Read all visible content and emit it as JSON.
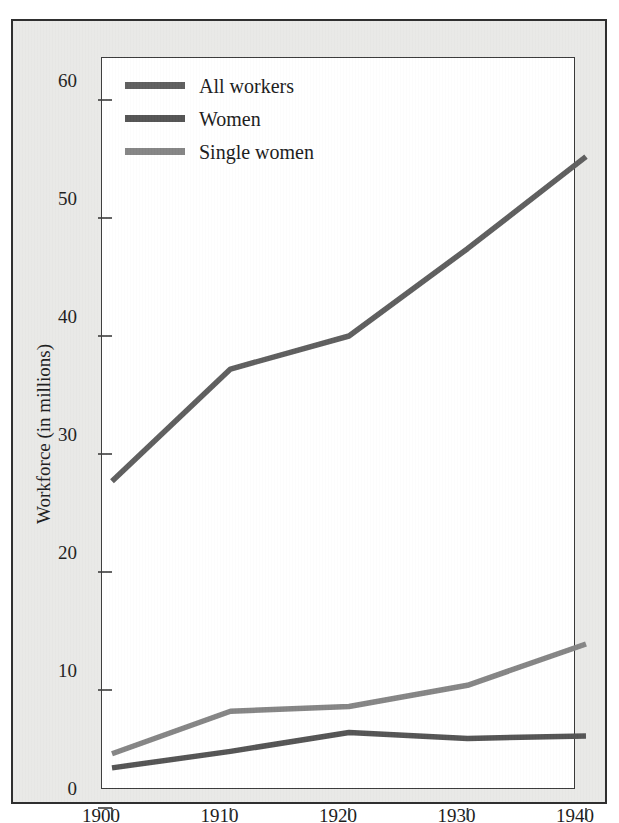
{
  "chart_data": {
    "type": "line",
    "title": "",
    "xlabel": "",
    "ylabel": "Workforce (in millions)",
    "x": [
      1900,
      1910,
      1920,
      1930,
      1940
    ],
    "xtick_labels": [
      "1900",
      "1910",
      "1920",
      "1930",
      "1940"
    ],
    "ytick_labels": [
      "0",
      "10",
      "20",
      "30",
      "40",
      "50",
      "60"
    ],
    "yticks": [
      0,
      10,
      20,
      30,
      40,
      50,
      60
    ],
    "xlim": [
      1900,
      1940
    ],
    "ylim": [
      0,
      63
    ],
    "grid": false,
    "legend_position": "top-left",
    "series": [
      {
        "name": "All workers",
        "color": "#5e5e5e",
        "values": [
          27.7,
          37.2,
          40.0,
          47.4,
          55.2
        ]
      },
      {
        "name": "Women",
        "color": "#545454",
        "values": [
          3.4,
          4.8,
          6.4,
          5.9,
          6.1
        ]
      },
      {
        "name": "Single women",
        "color": "#858585",
        "values": [
          4.6,
          8.2,
          8.6,
          10.4,
          13.9
        ]
      }
    ]
  },
  "legend": {
    "items": [
      {
        "label": "All workers",
        "swatch_color": "#5e5e5e"
      },
      {
        "label": "Women",
        "swatch_color": "#545454"
      },
      {
        "label": "Single women",
        "swatch_color": "#858585"
      }
    ]
  },
  "axes": {
    "y_title": "Workforce (in millions)",
    "y_labels": [
      "60",
      "50",
      "40",
      "30",
      "20",
      "10",
      "0"
    ],
    "x_labels": [
      "1900",
      "1910",
      "1920",
      "1930",
      "1940"
    ]
  },
  "colors": {
    "panel_background": "#e9e9e7",
    "plot_background": "#ffffff",
    "frame": "#2f2f2f",
    "axis": "#3a3a3a",
    "text": "#1d1d1d"
  }
}
